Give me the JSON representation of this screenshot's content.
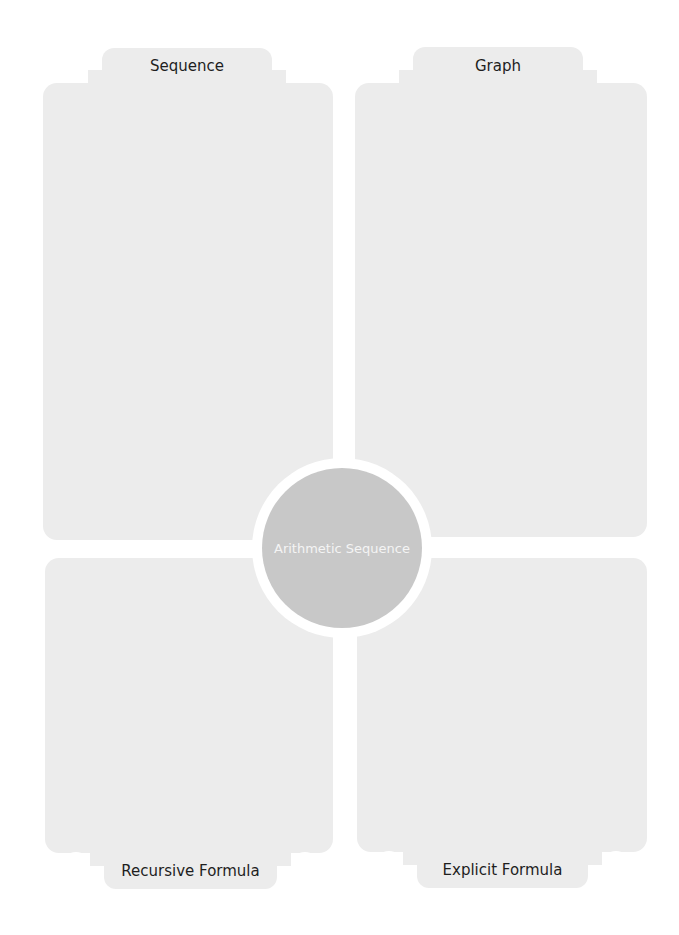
{
  "worksheet": {
    "center": {
      "label": "Arithmetic Sequence"
    },
    "quadrants": {
      "top_left": {
        "label": "Sequence"
      },
      "top_right": {
        "label": "Graph"
      },
      "bottom_left": {
        "label": "Recursive Formula"
      },
      "bottom_right": {
        "label": "Explicit Formula"
      }
    },
    "colors": {
      "panel": "#ececec",
      "center_circle": "#c8c8c8",
      "center_text": "#f4f4f4",
      "label_text": "#1e1e1e",
      "background": "#ffffff"
    }
  }
}
